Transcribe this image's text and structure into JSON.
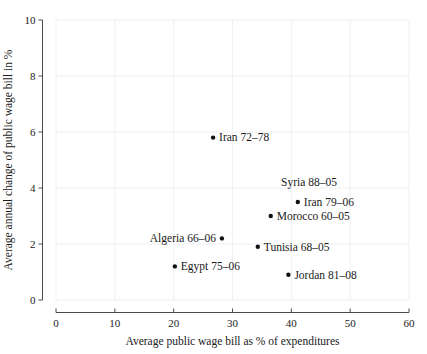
{
  "figure": {
    "background": "#ffffff",
    "axis_color": "#4a4a4a",
    "text_color": "#1a1a1a",
    "grid_color": "#f0f0f0",
    "point_color": "#111111"
  },
  "chart_data": {
    "type": "scatter",
    "title": "",
    "xlabel": "Average public wage bill as % of expenditures",
    "ylabel": "Average annual change of public wage bill in %",
    "xlim": [
      0,
      60
    ],
    "ylim": [
      0,
      10
    ],
    "x_ticks": [
      0,
      10,
      20,
      30,
      40,
      50,
      60
    ],
    "y_ticks": [
      0,
      2,
      4,
      6,
      8,
      10
    ],
    "grid": true,
    "legend": false,
    "points": [
      {
        "label": "Iran 72–78",
        "x": 26.7,
        "y": 5.8,
        "marker": true,
        "label_side": "right"
      },
      {
        "label": "Syria 88–05",
        "x": 43.0,
        "y": 4.2,
        "marker": false,
        "label_side": "center"
      },
      {
        "label": "Iran 79–06",
        "x": 41.1,
        "y": 3.5,
        "marker": true,
        "label_side": "right"
      },
      {
        "label": "Morocco 60–05",
        "x": 36.5,
        "y": 3.0,
        "marker": true,
        "label_side": "right"
      },
      {
        "label": "Algeria 66–06",
        "x": 28.2,
        "y": 2.2,
        "marker": true,
        "label_side": "left"
      },
      {
        "label": "Tunisia 68–05",
        "x": 34.3,
        "y": 1.9,
        "marker": true,
        "label_side": "right"
      },
      {
        "label": "Egypt 75–06",
        "x": 20.2,
        "y": 1.2,
        "marker": true,
        "label_side": "right"
      },
      {
        "label": "Jordan 81–08",
        "x": 39.5,
        "y": 0.9,
        "marker": true,
        "label_side": "right"
      }
    ]
  }
}
